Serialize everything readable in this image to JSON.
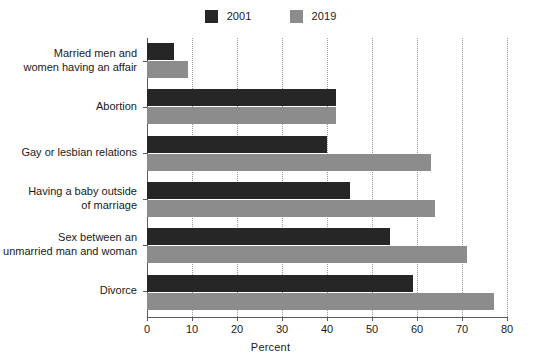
{
  "chart_data": {
    "type": "bar",
    "orientation": "horizontal",
    "title": "",
    "subtitle": "",
    "xlabel": "Percent",
    "ylabel": "",
    "xlim": [
      0,
      80
    ],
    "xticks": [
      0,
      10,
      20,
      30,
      40,
      50,
      60,
      70,
      80
    ],
    "xtick_labels": [
      "0",
      "10",
      "20",
      "30",
      "40",
      "50",
      "60",
      "70",
      "80"
    ],
    "grid": "vertical-dotted",
    "legend_position": "top-center",
    "categories": [
      "Married men and women having an affair",
      "Abortion",
      "Gay or lesbian relations",
      "Having a baby outside of marriage",
      "Sex between an unmarried man and woman",
      "Divorce"
    ],
    "category_lines": [
      [
        "Married men and",
        "women having an affair"
      ],
      [
        "Abortion"
      ],
      [
        "Gay or lesbian relations"
      ],
      [
        "Having a baby outside",
        "of marriage"
      ],
      [
        "Sex between an",
        "unmarried man and woman"
      ],
      [
        "Divorce"
      ]
    ],
    "series": [
      {
        "name": "2001",
        "color": "#262626",
        "values": [
          6,
          42,
          40,
          45,
          54,
          59
        ]
      },
      {
        "name": "2019",
        "color": "#8c8c8c",
        "values": [
          9,
          42,
          63,
          64,
          71,
          77
        ]
      }
    ]
  },
  "legend": {
    "entries": [
      {
        "label": "2001",
        "color": "#262626"
      },
      {
        "label": "2019",
        "color": "#8c8c8c"
      }
    ]
  },
  "axis": {
    "x_title": "Percent"
  }
}
